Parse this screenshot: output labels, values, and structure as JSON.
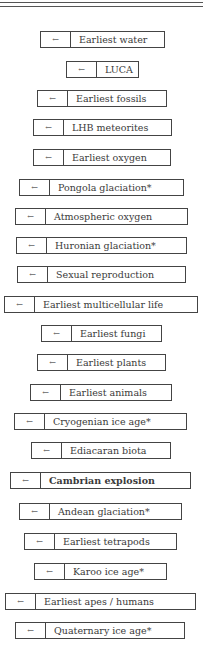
{
  "items": [
    {
      "label": "Earliest water",
      "left": 40,
      "right": 165,
      "top": 31,
      "icon": "arrow-left-icon",
      "arrow": "←"
    },
    {
      "label": "LUCA",
      "left": 66,
      "right": 139,
      "top": 61,
      "icon": "arrow-left-icon",
      "arrow": "←"
    },
    {
      "label": "Earliest fossils",
      "left": 37,
      "right": 167,
      "top": 90,
      "icon": "arrow-left-icon",
      "arrow": "←"
    },
    {
      "label": "LHB meteorites",
      "left": 33,
      "right": 172,
      "top": 119,
      "icon": "arrow-left-icon",
      "arrow": "←"
    },
    {
      "label": "Earliest oxygen",
      "left": 33,
      "right": 171,
      "top": 149,
      "icon": "arrow-left-icon",
      "arrow": "←"
    },
    {
      "label": "Pongola glaciation*",
      "left": 19,
      "right": 184,
      "top": 179,
      "icon": "arrow-left-icon",
      "arrow": "←"
    },
    {
      "label": "Atmospheric oxygen",
      "left": 15,
      "right": 188,
      "top": 208,
      "icon": "arrow-left-icon",
      "arrow": "←"
    },
    {
      "label": "Huronian glaciation*",
      "left": 16,
      "right": 187,
      "top": 237,
      "icon": "arrow-left-icon",
      "arrow": "←"
    },
    {
      "label": "Sexual reproduction",
      "left": 17,
      "right": 186,
      "top": 266,
      "icon": "arrow-left-icon",
      "arrow": "←"
    },
    {
      "label": "Earliest multicellular life",
      "left": 4,
      "right": 198,
      "top": 296,
      "icon": "arrow-left-icon",
      "arrow": "←"
    },
    {
      "label": "Earliest fungi",
      "left": 41,
      "right": 162,
      "top": 325,
      "icon": "arrow-left-icon",
      "arrow": "←"
    },
    {
      "label": "Earliest plants",
      "left": 37,
      "right": 166,
      "top": 354,
      "icon": "arrow-left-icon",
      "arrow": "←"
    },
    {
      "label": "Earliest animals",
      "left": 30,
      "right": 172,
      "top": 384,
      "icon": "arrow-left-icon",
      "arrow": "←"
    },
    {
      "label": "Cryogenian ice age*",
      "left": 14,
      "right": 187,
      "top": 413,
      "icon": "arrow-left-icon",
      "arrow": "←"
    },
    {
      "label": "Ediacaran biota",
      "left": 31,
      "right": 171,
      "top": 442,
      "icon": "arrow-left-icon",
      "arrow": "←"
    },
    {
      "label": "Cambrian explosion",
      "left": 10,
      "right": 191,
      "top": 472,
      "icon": "arrow-left-icon",
      "arrow": "←",
      "bold": true
    },
    {
      "label": "Andean glaciation*",
      "left": 19,
      "right": 182,
      "top": 503,
      "icon": "arrow-left-icon",
      "arrow": "←"
    },
    {
      "label": "Earliest tetrapods",
      "left": 24,
      "right": 177,
      "top": 533,
      "icon": "arrow-left-icon",
      "arrow": "←"
    },
    {
      "label": "Karoo ice age*",
      "left": 34,
      "right": 167,
      "top": 563,
      "icon": "arrow-left-icon",
      "arrow": "←"
    },
    {
      "label": "Earliest apes / humans",
      "left": 5,
      "right": 196,
      "top": 593,
      "icon": "arrow-left-icon",
      "arrow": "←"
    },
    {
      "label": "Quaternary ice age*",
      "left": 15,
      "right": 185,
      "top": 622,
      "icon": "arrow-left-icon",
      "arrow": "←"
    }
  ]
}
